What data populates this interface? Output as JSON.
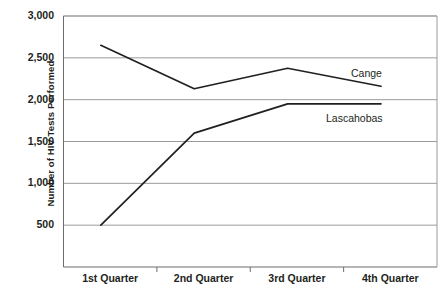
{
  "chart_data": {
    "type": "line",
    "title": "",
    "xlabel": "",
    "ylabel": "Number of HIV Tests Performed",
    "categories": [
      "1st Quarter",
      "2nd Quarter",
      "3rd Quarter",
      "4th Quarter"
    ],
    "series": [
      {
        "name": "Cange",
        "values": [
          2650,
          2130,
          2375,
          2160
        ]
      },
      {
        "name": "Lascahobas",
        "values": [
          500,
          1600,
          1950,
          1950
        ]
      }
    ],
    "ylim": [
      0,
      3000
    ],
    "ytick_values": [
      3000,
      2500,
      2000,
      1500,
      1000,
      500
    ],
    "ytick_labels": [
      "3,000",
      "2,500",
      "2,000",
      "1,500",
      "1,000",
      "500"
    ],
    "grid": true,
    "legend_position": "right-inline",
    "colors": {
      "line": "#231f20",
      "grid": "#9b9b9b",
      "axis": "#6d6d6d",
      "text": "#231f20",
      "background": "#ffffff"
    }
  }
}
